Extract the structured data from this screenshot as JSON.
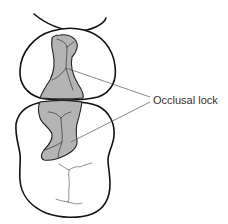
{
  "figure": {
    "label": "Occlusal lock",
    "colors": {
      "outline": "#111111",
      "inlay_fill": "#b4b4b4",
      "leader": "#555555",
      "label": "#333333",
      "background": "#ffffff"
    },
    "elements": [
      {
        "name": "adjacent-tooth-edge",
        "description": "partial outline of neighboring tooth at top"
      },
      {
        "name": "upper-tooth",
        "description": "premolar outline with occlusal inlay"
      },
      {
        "name": "lower-tooth",
        "description": "molar outline with occlusal inlay and fissures"
      }
    ]
  }
}
